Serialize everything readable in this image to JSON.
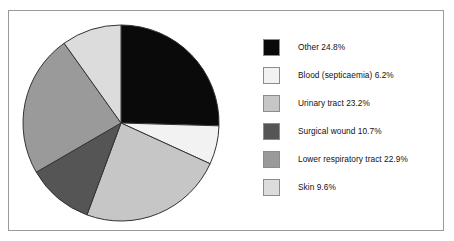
{
  "chart_data": {
    "type": "pie",
    "title": "",
    "categories": [
      "Other",
      "Blood (septicaemia)",
      "Urinary tract",
      "Surgical wound",
      "Lower respiratory tract",
      "Skin"
    ],
    "values": [
      24.8,
      6.2,
      23.2,
      10.7,
      22.9,
      9.6
    ],
    "value_unit": "%",
    "start_angle_deg": 0,
    "direction": "clockwise",
    "legend_position": "right",
    "grid": false,
    "slice_colors": [
      "#0a0a0a",
      "#f2f2f2",
      "#c6c6c6",
      "#555555",
      "#9a9a9a",
      "#dcdcdc"
    ],
    "slice_edge_color": "#333333",
    "labels": [
      "Other 24.8%",
      "Blood (septicaemia) 6.2%",
      "Urinary tract 23.2%",
      "Surgical wound 10.7%",
      "Lower respiratory tract 22.9%",
      "Skin 9.6%"
    ]
  },
  "legend": {
    "items": [
      {
        "label": "Other 24.8%",
        "color": "#0a0a0a"
      },
      {
        "label": "Blood (septicaemia) 6.2%",
        "color": "#f2f2f2"
      },
      {
        "label": "Urinary tract 23.2%",
        "color": "#c6c6c6"
      },
      {
        "label": "Surgical wound 10.7%",
        "color": "#555555"
      },
      {
        "label": "Lower respiratory tract 22.9%",
        "color": "#9a9a9a"
      },
      {
        "label": "Skin 9.6%",
        "color": "#dcdcdc"
      }
    ]
  },
  "frame": {
    "border_color": "#9a9a9a",
    "background": "#ffffff"
  }
}
